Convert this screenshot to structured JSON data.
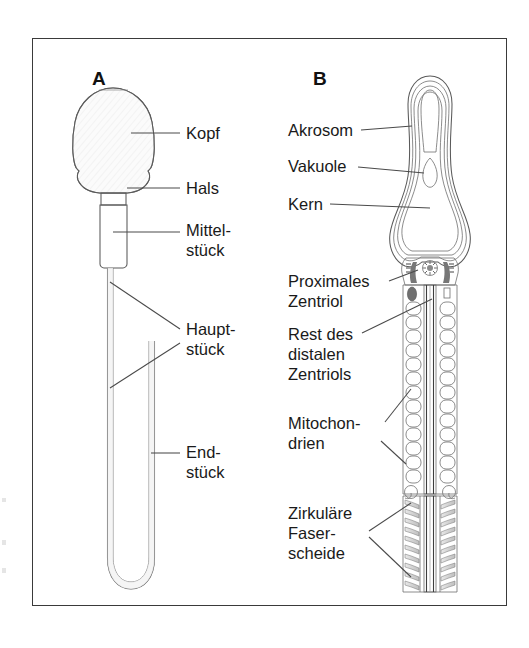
{
  "figure": {
    "language": "de"
  },
  "panels": [
    {
      "id": "A",
      "letter": "A",
      "caption": "Gesamtansicht",
      "labels": [
        {
          "key": "kopf",
          "text": "Kopf",
          "lines": [
            "Kopf"
          ]
        },
        {
          "key": "hals",
          "text": "Hals",
          "lines": [
            "Hals"
          ]
        },
        {
          "key": "mittelstueck",
          "text": "Mittelstück",
          "lines": [
            "Mittel-",
            "stück"
          ]
        },
        {
          "key": "hauptstueck",
          "text": "Hauptstück",
          "lines": [
            "Haupt-",
            "stück"
          ]
        },
        {
          "key": "endstueck",
          "text": "Endstück",
          "lines": [
            "End-",
            "stück"
          ]
        }
      ]
    },
    {
      "id": "B",
      "letter": "B",
      "caption": "Längsschnitt",
      "labels": [
        {
          "key": "akrosom",
          "text": "Akrosom",
          "lines": [
            "Akrosom"
          ]
        },
        {
          "key": "vakuole",
          "text": "Vakuole",
          "lines": [
            "Vakuole"
          ]
        },
        {
          "key": "kern",
          "text": "Kern",
          "lines": [
            "Kern"
          ]
        },
        {
          "key": "proximales_zentriol",
          "text": "Proximales Zentriol",
          "lines": [
            "Proximales",
            "Zentriol"
          ]
        },
        {
          "key": "rest_distales_zentriol",
          "text": "Rest des distalen Zentriols",
          "lines": [
            "Rest des",
            "distalen",
            "Zentriols"
          ]
        },
        {
          "key": "mitochondrien",
          "text": "Mitochondrien",
          "lines": [
            "Mitochon-",
            "drien"
          ]
        },
        {
          "key": "zirkulaere_faserscheide",
          "text": "Zirkuläre Faserscheide",
          "lines": [
            "Zirkuläre",
            "Faser-",
            "scheide"
          ]
        }
      ]
    }
  ],
  "colors": {
    "frame": "#3a3a3a",
    "outline": "#5a5a5a",
    "leader": "#4a4a4a",
    "text": "#1a1a1a",
    "fill_light": "#f4f4f4",
    "fill_mid": "#c9c9c9",
    "fill_dark": "#8d8d8d",
    "background": "#ffffff"
  }
}
